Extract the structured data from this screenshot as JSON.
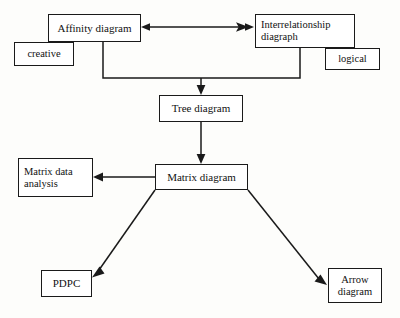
{
  "diagram": {
    "background_color": "#fdfdfb",
    "line_color": "#1a1a1a",
    "box_fill": "#ffffff",
    "nodes": [
      {
        "id": "affinity",
        "label": "Affinity diagram",
        "x": 48,
        "y": 14,
        "w": 93,
        "h": 28,
        "align": "c",
        "font_size": 11
      },
      {
        "id": "creative",
        "label": "creative",
        "x": 14,
        "y": 42,
        "w": 60,
        "h": 24,
        "align": "c",
        "font_size": 10.5
      },
      {
        "id": "interrelationship",
        "label": "Interrelationship\ndiagraph",
        "x": 255,
        "y": 14,
        "w": 100,
        "h": 34,
        "align": "l",
        "font_size": 10.5
      },
      {
        "id": "logical",
        "label": "logical",
        "x": 325,
        "y": 48,
        "w": 55,
        "h": 22,
        "align": "c",
        "font_size": 10.5
      },
      {
        "id": "tree",
        "label": "Tree diagram",
        "x": 159,
        "y": 95,
        "w": 84,
        "h": 27,
        "align": "c",
        "font_size": 11
      },
      {
        "id": "matrix-data",
        "label": "Matrix data\nanalysis",
        "x": 18,
        "y": 158,
        "w": 75,
        "h": 39,
        "align": "l",
        "font_size": 10.5
      },
      {
        "id": "matrix",
        "label": "Matrix diagram",
        "x": 155,
        "y": 164,
        "w": 93,
        "h": 26,
        "align": "c",
        "font_size": 11
      },
      {
        "id": "pdpc",
        "label": "PDPC",
        "x": 41,
        "y": 270,
        "w": 51,
        "h": 27,
        "align": "c",
        "font_size": 11
      },
      {
        "id": "arrow",
        "label": "Arrow\ndiagram",
        "x": 328,
        "y": 268,
        "w": 54,
        "h": 35,
        "align": "c",
        "font_size": 10.5
      }
    ],
    "edges": [
      {
        "id": "affinity-interrelationship",
        "from": "affinity",
        "to": "interrelationship",
        "type": "double-arrow-horizontal",
        "points": "141,27 254,27"
      },
      {
        "id": "affinity-bracket-tree",
        "from": "affinity",
        "to": "tree",
        "type": "elbow-arrow",
        "points": "103,42 103,78 300,78 300,48"
      },
      {
        "id": "bracket-down-tree",
        "from": "bracket",
        "to": "tree",
        "type": "arrow-down",
        "points": "201,78 201,94"
      },
      {
        "id": "tree-matrix",
        "from": "tree",
        "to": "matrix",
        "type": "arrow-down",
        "points": "201,122 201,163"
      },
      {
        "id": "matrix-matrixdata",
        "from": "matrix",
        "to": "matrix-data",
        "type": "arrow-left",
        "points": "155,177 95,177"
      },
      {
        "id": "matrix-pdpc",
        "from": "matrix",
        "to": "pdpc",
        "type": "arrow-diagonal",
        "points": "155,190 91,277"
      },
      {
        "id": "matrix-arrowdiagram",
        "from": "matrix",
        "to": "arrow",
        "type": "arrow-diagonal",
        "points": "248,190 326,284"
      }
    ]
  }
}
